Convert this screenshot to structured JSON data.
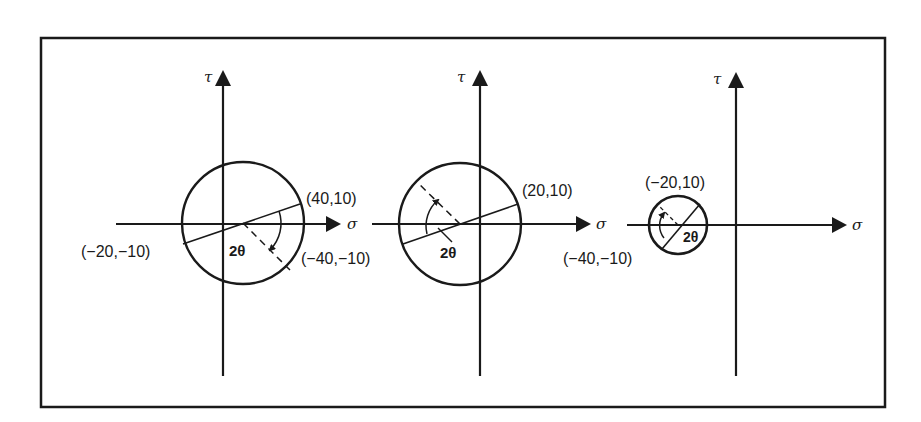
{
  "figure": {
    "frame": {
      "x": 41,
      "y": 38,
      "width": 844,
      "height": 369
    },
    "stroke_color": "#1a1a1a",
    "background": "#ffffff",
    "panels": [
      {
        "id": "panel-1",
        "axes": {
          "origin": {
            "x": 223,
            "y": 224
          },
          "sigma_axis": {
            "x_start": 116,
            "x_end": 341,
            "label": "σ"
          },
          "tau_axis": {
            "y_top": 70,
            "y_bottom": 376,
            "label": "τ"
          }
        },
        "circle": {
          "cx": 243,
          "cy": 223,
          "r": 61
        },
        "diameter": {
          "x1": 183,
          "y1": 244,
          "x2": 300,
          "y2": 204
        },
        "dashed_line": {
          "x1": 243,
          "y1": 223,
          "x2": 290,
          "y2": 270
        },
        "angle_label": "2θ",
        "points": [
          {
            "label": "(40,10)",
            "x": 306,
            "y": 198
          },
          {
            "label": "(−20,−10)",
            "x": 81,
            "y": 257
          },
          {
            "label": "(−40,−10)",
            "x": 301,
            "y": 264
          }
        ]
      },
      {
        "id": "panel-2",
        "axes": {
          "origin": {
            "x": 480,
            "y": 224
          },
          "sigma_axis": {
            "x_start": 372,
            "x_end": 590,
            "label": "σ"
          },
          "tau_axis": {
            "y_top": 70,
            "y_bottom": 376,
            "label": "τ"
          }
        },
        "circle": {
          "cx": 460,
          "cy": 224,
          "r": 61
        },
        "diameter": {
          "x1": 403,
          "y1": 244,
          "x2": 518,
          "y2": 204
        },
        "dashed_line": {
          "x1": 460,
          "y1": 224,
          "x2": 418,
          "y2": 183
        },
        "angle_label": "2θ",
        "points": [
          {
            "label": "(20,10)",
            "x": 522,
            "y": 196
          }
        ]
      },
      {
        "id": "panel-3",
        "axes": {
          "origin": {
            "x": 736,
            "y": 225
          },
          "sigma_axis": {
            "x_start": 627,
            "x_end": 847,
            "label": "σ"
          },
          "tau_axis": {
            "y_top": 72,
            "y_bottom": 376,
            "label": "τ"
          }
        },
        "circle": {
          "cx": 678,
          "cy": 225,
          "r": 29
        },
        "diameter": {
          "x1": 662,
          "y1": 249,
          "x2": 700,
          "y2": 204
        },
        "dashed_line": {
          "x1": 678,
          "y1": 225,
          "x2": 659,
          "y2": 206
        },
        "angle_label": "2θ",
        "points": [
          {
            "label": "(−20,10)",
            "x": 645,
            "y": 188
          },
          {
            "label": "(−40,−10)",
            "x": 563,
            "y": 264
          }
        ]
      }
    ]
  }
}
